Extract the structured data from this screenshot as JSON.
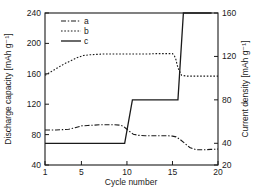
{
  "chart_data": {
    "type": "line",
    "title": "",
    "xlabel": "Cycle number",
    "ylabel": "Discharge capacity [mAh g⁻¹]",
    "y2label": "Current density [mAh g⁻¹]",
    "xlim": [
      1,
      20
    ],
    "ylim": [
      40,
      240
    ],
    "y2lim": [
      20,
      160
    ],
    "xticks": [
      1,
      5,
      10,
      15,
      20
    ],
    "yticks": [
      40,
      80,
      120,
      160,
      200,
      240
    ],
    "y2ticks": [
      20,
      40,
      80,
      120,
      160
    ],
    "grid": false,
    "legend_position": "top-left",
    "series": [
      {
        "name": "a",
        "style": "dashdot",
        "axis": "left",
        "x": [
          1,
          1.6,
          2.2,
          2.9,
          3.6,
          4.3,
          5.0,
          5.7,
          6.4,
          7.1,
          7.8,
          8.5,
          9.2,
          9.6,
          9.9,
          10.3,
          10.7,
          11.3,
          12.0,
          12.8,
          13.6,
          14.4,
          15.0,
          15.4,
          15.8,
          16.3,
          16.9,
          17.6,
          18.4,
          19.2,
          20.0
        ],
        "y": [
          86,
          86,
          86,
          86.5,
          87,
          89,
          91.5,
          92,
          92.5,
          93,
          93,
          93,
          92.5,
          91,
          88,
          84,
          80.5,
          79,
          78.5,
          78.5,
          78.5,
          78.5,
          78,
          77,
          74,
          69,
          63,
          60,
          60,
          60.5,
          61
        ]
      },
      {
        "name": "b",
        "style": "dotted",
        "axis": "left",
        "x": [
          1,
          1.7,
          2.4,
          3.1,
          3.8,
          4.5,
          5.2,
          5.9,
          6.6,
          7.4,
          8.2,
          9.0,
          9.8,
          10.6,
          11.4,
          12.2,
          13.0,
          13.8,
          14.6,
          15.0,
          15.2,
          15.4,
          15.5,
          15.7,
          16.0,
          16.6,
          17.3,
          18.1,
          18.9,
          19.6,
          20.0
        ],
        "y": [
          158,
          163,
          168,
          173,
          177,
          181,
          184,
          185,
          185.5,
          186,
          186,
          186,
          186,
          186,
          186,
          186,
          186.5,
          186.5,
          186.5,
          186.5,
          184,
          178,
          172,
          165,
          158,
          157,
          157,
          157,
          157,
          157,
          157
        ]
      },
      {
        "name": "c",
        "style": "solid",
        "axis": "right",
        "x": [
          1,
          9.6,
          9.75,
          10.6,
          15.4,
          15.6,
          16.2,
          19.3
        ],
        "y": [
          40,
          40,
          40,
          80,
          80,
          80,
          160,
          160
        ],
        "y_left_equiv": [
          60,
          60,
          60,
          119,
          119,
          119,
          236,
          236
        ],
        "step_note": "step curve: 40 mAh g-1 for cycles 1-10, 80 for cycles 11-15, 160 for cycles 16-20"
      }
    ],
    "legend": [
      {
        "label": "a",
        "style": "dashdot"
      },
      {
        "label": "b",
        "style": "dotted"
      },
      {
        "label": "c",
        "style": "solid"
      }
    ]
  }
}
